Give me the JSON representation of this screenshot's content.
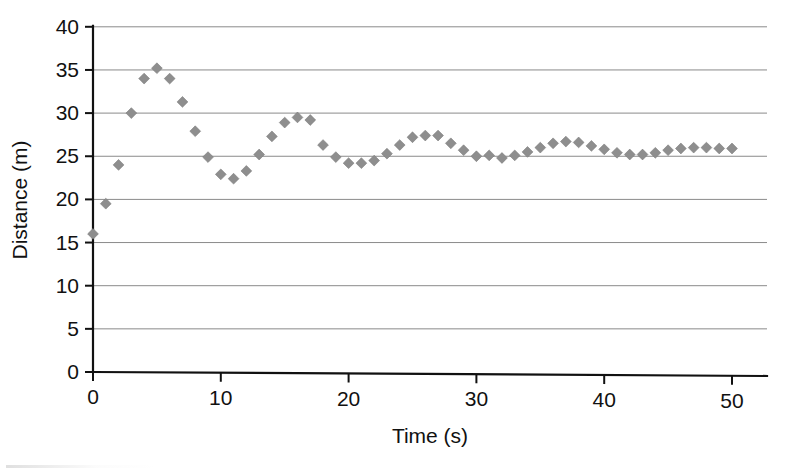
{
  "chart_data": {
    "type": "scatter",
    "title": "",
    "xlabel": "Time (s)",
    "ylabel": "Distance (m)",
    "xlim": [
      0,
      54
    ],
    "ylim": [
      0,
      40
    ],
    "xticks": [
      0,
      10,
      20,
      30,
      40,
      50
    ],
    "xtick_labels": [
      "0",
      "10",
      "20",
      "30",
      "40",
      "50"
    ],
    "yticks": [
      0,
      5,
      10,
      15,
      20,
      25,
      30,
      35,
      40
    ],
    "ytick_labels": [
      "0",
      "5",
      "10",
      "15",
      "20",
      "25",
      "30",
      "35",
      "40"
    ],
    "grid": "horizontal",
    "legend": "none",
    "marker": "diamond",
    "marker_color": "#8e8e8e",
    "series": [
      {
        "name": "Distance vs Time",
        "x": [
          0,
          1,
          2,
          3,
          4,
          5,
          6,
          7,
          8,
          9,
          10,
          11,
          12,
          13,
          14,
          15,
          16,
          17,
          18,
          19,
          20,
          21,
          22,
          23,
          24,
          25,
          26,
          27,
          28,
          29,
          30,
          31,
          32,
          33,
          34,
          35,
          36,
          37,
          38,
          39,
          40,
          41,
          42,
          43,
          44,
          45,
          46,
          47,
          48,
          49,
          50
        ],
        "y": [
          16.0,
          19.5,
          24.0,
          30.0,
          34.0,
          35.2,
          34.0,
          31.3,
          27.9,
          24.9,
          22.9,
          22.4,
          23.3,
          25.2,
          27.3,
          28.9,
          29.5,
          29.2,
          26.3,
          24.9,
          24.2,
          24.2,
          24.5,
          25.3,
          26.3,
          27.2,
          27.4,
          27.4,
          26.5,
          25.7,
          25.0,
          25.1,
          24.8,
          25.1,
          25.5,
          26.0,
          26.5,
          26.7,
          26.6,
          26.2,
          25.8,
          25.4,
          25.2,
          25.2,
          25.4,
          25.7,
          25.9,
          26.0,
          26.0,
          25.9,
          25.9
        ]
      }
    ]
  },
  "axes": {
    "x_title": "Time (s)",
    "y_title": "Distance (m)"
  }
}
